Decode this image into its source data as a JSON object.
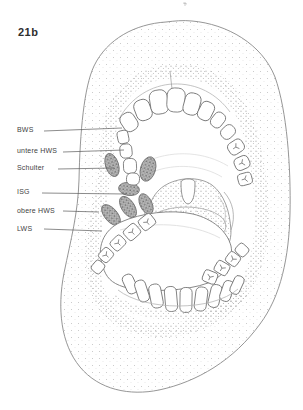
{
  "figure": {
    "number": "21b"
  },
  "annotations": {
    "labels": [
      {
        "text": "BWS"
      },
      {
        "text": "untere HWS"
      },
      {
        "text": "Schulter"
      },
      {
        "text": "ISG"
      },
      {
        "text": "obere HWS"
      },
      {
        "text": "LWS"
      }
    ]
  },
  "colors": {
    "ink": "#6a6a6a",
    "label_text": "#3f3f3f",
    "highlight_gray": "#9a9a9a",
    "background": "#ffffff"
  }
}
